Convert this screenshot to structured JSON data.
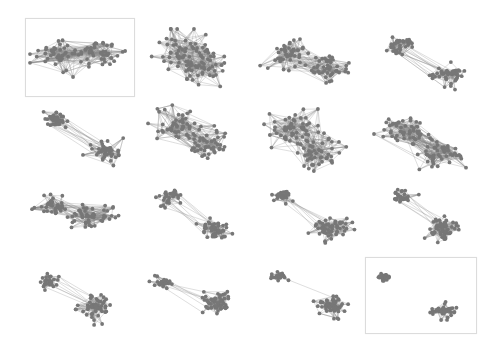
{
  "figure": {
    "node_color": "#777777",
    "edge_color": "#8a8a8a",
    "frame_color": "#dcdcdc",
    "panels": [
      {
        "id": 1,
        "x": 25,
        "y": 18,
        "w": 108,
        "h": 77,
        "framed": true,
        "c1": [
          0.3,
          0.45
        ],
        "c2": [
          0.72,
          0.45
        ],
        "r1": 0.22,
        "r2": 0.2,
        "n1": 45,
        "n2": 45,
        "inter": 70,
        "seed": 1
      },
      {
        "id": 2,
        "x": 140,
        "y": 25,
        "w": 100,
        "h": 70,
        "framed": false,
        "c1": [
          0.4,
          0.35
        ],
        "c2": [
          0.65,
          0.65
        ],
        "r1": 0.28,
        "r2": 0.28,
        "n1": 50,
        "n2": 50,
        "inter": 80,
        "seed": 2
      },
      {
        "id": 3,
        "x": 255,
        "y": 25,
        "w": 100,
        "h": 70,
        "framed": false,
        "c1": [
          0.3,
          0.4
        ],
        "c2": [
          0.75,
          0.65
        ],
        "r1": 0.22,
        "r2": 0.2,
        "n1": 45,
        "n2": 45,
        "inter": 40,
        "seed": 3
      },
      {
        "id": 4,
        "x": 375,
        "y": 25,
        "w": 100,
        "h": 70,
        "framed": false,
        "c1": [
          0.25,
          0.25
        ],
        "c2": [
          0.75,
          0.72
        ],
        "r1": 0.15,
        "r2": 0.18,
        "n1": 40,
        "n2": 45,
        "inter": 14,
        "seed": 4
      },
      {
        "id": 5,
        "x": 35,
        "y": 100,
        "w": 100,
        "h": 70,
        "framed": false,
        "c1": [
          0.2,
          0.25
        ],
        "c2": [
          0.75,
          0.75
        ],
        "r1": 0.13,
        "r2": 0.15,
        "n1": 40,
        "n2": 45,
        "inter": 14,
        "seed": 5
      },
      {
        "id": 6,
        "x": 140,
        "y": 100,
        "w": 100,
        "h": 70,
        "framed": false,
        "c1": [
          0.35,
          0.35
        ],
        "c2": [
          0.68,
          0.62
        ],
        "r1": 0.25,
        "r2": 0.25,
        "n1": 48,
        "n2": 48,
        "inter": 60,
        "seed": 6
      },
      {
        "id": 7,
        "x": 255,
        "y": 105,
        "w": 100,
        "h": 70,
        "framed": false,
        "c1": [
          0.35,
          0.35
        ],
        "c2": [
          0.65,
          0.7
        ],
        "r1": 0.26,
        "r2": 0.24,
        "n1": 50,
        "n2": 50,
        "inter": 70,
        "seed": 7
      },
      {
        "id": 8,
        "x": 370,
        "y": 105,
        "w": 100,
        "h": 70,
        "framed": false,
        "c1": [
          0.35,
          0.35
        ],
        "c2": [
          0.68,
          0.7
        ],
        "r1": 0.26,
        "r2": 0.24,
        "n1": 50,
        "n2": 50,
        "inter": 70,
        "seed": 8
      },
      {
        "id": 9,
        "x": 25,
        "y": 180,
        "w": 100,
        "h": 70,
        "framed": false,
        "c1": [
          0.25,
          0.35
        ],
        "c2": [
          0.68,
          0.5
        ],
        "r1": 0.17,
        "r2": 0.22,
        "n1": 35,
        "n2": 50,
        "inter": 30,
        "seed": 9
      },
      {
        "id": 10,
        "x": 140,
        "y": 180,
        "w": 100,
        "h": 70,
        "framed": false,
        "c1": [
          0.28,
          0.22
        ],
        "c2": [
          0.75,
          0.72
        ],
        "r1": 0.13,
        "r2": 0.16,
        "n1": 30,
        "n2": 50,
        "inter": 10,
        "seed": 10
      },
      {
        "id": 11,
        "x": 260,
        "y": 180,
        "w": 100,
        "h": 70,
        "framed": false,
        "c1": [
          0.2,
          0.2
        ],
        "c2": [
          0.72,
          0.7
        ],
        "r1": 0.1,
        "r2": 0.17,
        "n1": 25,
        "n2": 55,
        "inter": 8,
        "seed": 11
      },
      {
        "id": 12,
        "x": 375,
        "y": 180,
        "w": 100,
        "h": 70,
        "framed": false,
        "c1": [
          0.25,
          0.2
        ],
        "c2": [
          0.68,
          0.72
        ],
        "r1": 0.12,
        "r2": 0.17,
        "n1": 28,
        "n2": 55,
        "inter": 8,
        "seed": 12
      },
      {
        "id": 13,
        "x": 25,
        "y": 260,
        "w": 100,
        "h": 70,
        "framed": false,
        "c1": [
          0.2,
          0.28
        ],
        "c2": [
          0.72,
          0.68
        ],
        "r1": 0.12,
        "r2": 0.17,
        "n1": 28,
        "n2": 55,
        "inter": 8,
        "seed": 13
      },
      {
        "id": 14,
        "x": 140,
        "y": 260,
        "w": 100,
        "h": 70,
        "framed": false,
        "c1": [
          0.2,
          0.3
        ],
        "c2": [
          0.78,
          0.62
        ],
        "r1": 0.1,
        "r2": 0.17,
        "n1": 25,
        "n2": 55,
        "inter": 7,
        "seed": 14
      },
      {
        "id": 15,
        "x": 260,
        "y": 258,
        "w": 100,
        "h": 70,
        "framed": false,
        "c1": [
          0.15,
          0.22
        ],
        "c2": [
          0.72,
          0.72
        ],
        "r1": 0.08,
        "r2": 0.15,
        "n1": 22,
        "n2": 55,
        "inter": 1,
        "seed": 15
      },
      {
        "id": 16,
        "x": 365,
        "y": 257,
        "w": 110,
        "h": 75,
        "framed": true,
        "c1": [
          0.14,
          0.22
        ],
        "c2": [
          0.73,
          0.72
        ],
        "r1": 0.07,
        "r2": 0.11,
        "n1": 22,
        "n2": 50,
        "inter": 0,
        "seed": 16
      }
    ]
  }
}
